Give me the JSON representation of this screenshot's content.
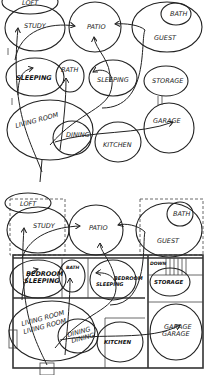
{
  "diagram_1": {
    "title": "Bubble diagram",
    "bubbles": [
      {
        "id": "loft",
        "label": "LOFT"
      },
      {
        "id": "study",
        "label": "STUDY"
      },
      {
        "id": "patio",
        "label": "PATIO"
      },
      {
        "id": "bath_guest",
        "label": "BATH"
      },
      {
        "id": "guest",
        "label": "GUEST"
      },
      {
        "id": "sleeping_1",
        "label": "SLEEPING"
      },
      {
        "id": "bath",
        "label": "BATH"
      },
      {
        "id": "sleeping_2",
        "label": "SLEEPING"
      },
      {
        "id": "storage",
        "label": "STORAGE"
      },
      {
        "id": "living",
        "label": "LIVING ROOM"
      },
      {
        "id": "dining",
        "label": "DINING"
      },
      {
        "id": "kitchen",
        "label": "KITCHEN"
      },
      {
        "id": "garage",
        "label": "GARAGE"
      }
    ]
  },
  "diagram_2": {
    "title": "Floor plan overlay",
    "labels": {
      "loft": "LOFT",
      "study": "STUDY",
      "patio": "PATIO",
      "bath_guest": "BATH",
      "guest": "GUEST",
      "bedroom_1": "BEDROOM",
      "sleeping_1": "SLEEPING",
      "bath": "BATH",
      "bedroom_2": "BEDROOM",
      "sleeping_2": "SLEEPING",
      "down": "DOWN",
      "storage": "STORAGE",
      "living_1": "LIVING ROOM",
      "living_2": "LIVING ROOM",
      "dining_1": "DINING",
      "dining_2": "DINING",
      "kitchen_1": "KITCHEN",
      "kitchen_2": "KITCHEN",
      "garage_1": "GARAGE",
      "garage_2": "GARAGE"
    }
  }
}
